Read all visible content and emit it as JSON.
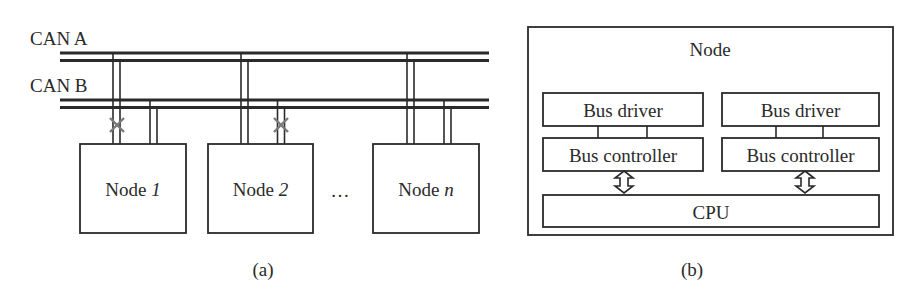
{
  "diagram_a": {
    "caption": "(a)",
    "buses": [
      {
        "label": "CAN A"
      },
      {
        "label": "CAN B"
      }
    ],
    "nodes": [
      {
        "prefix": "Node ",
        "index": "1",
        "can_a_failed": true,
        "can_b_failed": false
      },
      {
        "prefix": "Node ",
        "index": "2",
        "can_a_failed": false,
        "can_b_failed": true
      },
      {
        "prefix": "Node ",
        "index": "n",
        "can_a_failed": false,
        "can_b_failed": false
      }
    ],
    "ellipsis": "…"
  },
  "diagram_b": {
    "caption": "(b)",
    "title": "Node",
    "channels": [
      {
        "driver": "Bus driver",
        "controller": "Bus controller"
      },
      {
        "driver": "Bus driver",
        "controller": "Bus controller"
      }
    ],
    "cpu": "CPU"
  },
  "colors": {
    "line": "#2a2a2a",
    "failure_mark": "#7a7a7a",
    "background": "#ffffff"
  }
}
